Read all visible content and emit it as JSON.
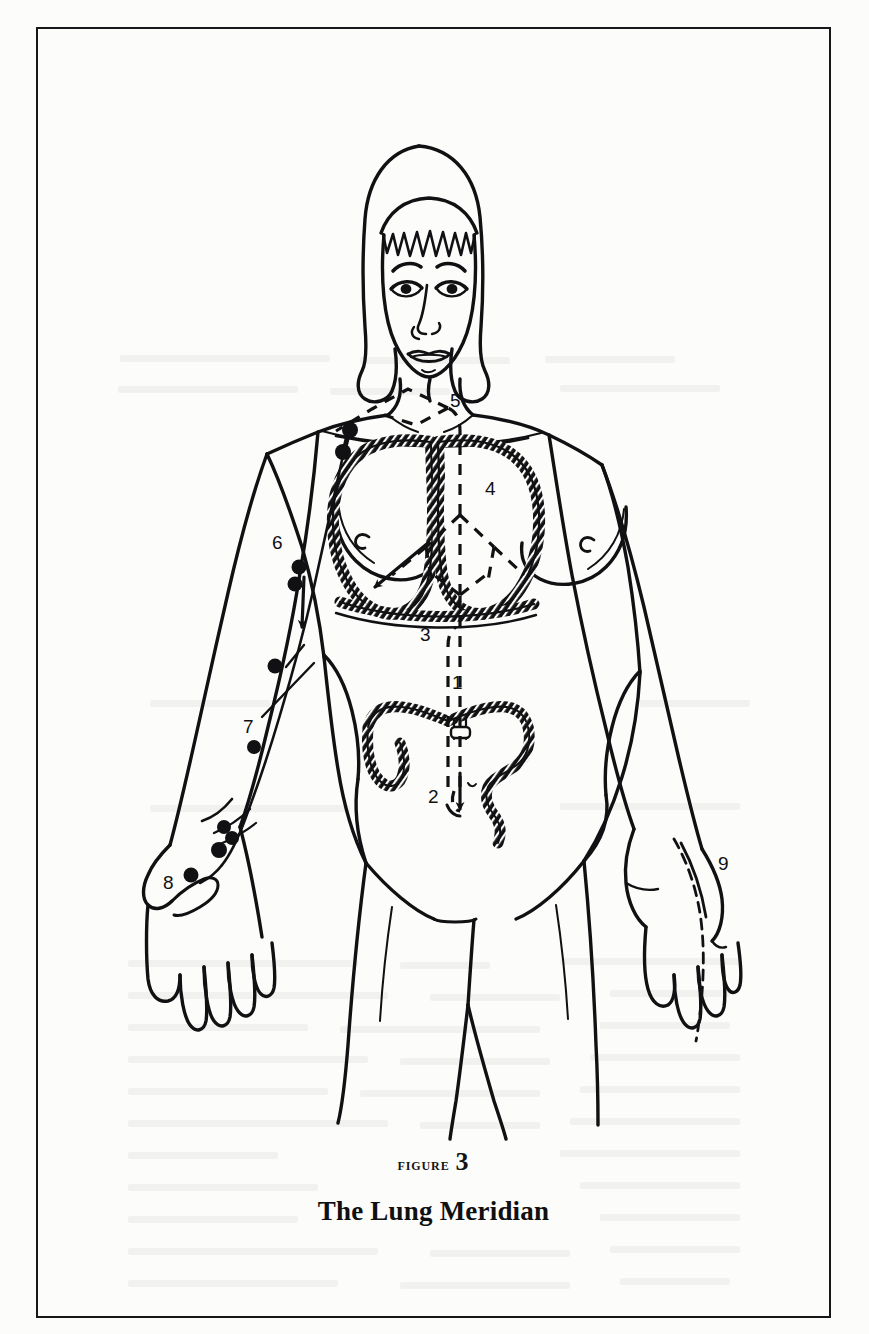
{
  "page": {
    "background_color": "#fcfcfa",
    "ink_color": "#141416",
    "width": 869,
    "height": 1334
  },
  "figure": {
    "frame": {
      "border_color": "#17171a",
      "border_width": 2
    },
    "caption": {
      "figure_word": "Figure",
      "figure_number": "3",
      "title": "The Lung Meridian"
    },
    "illustration": {
      "subject": "female-anatomical-figure-front-view",
      "description": "Line drawing of a standing woman, front view, showing the Lung meridian pathway with numbered reference points.",
      "organs_depicted": [
        "lungs",
        "diaphragm",
        "large-intestine",
        "stomach"
      ],
      "meridian_style": {
        "solid_line_meaning": "surface pathway",
        "dashed_line_meaning": "internal pathway",
        "point_marker": "filled-circle"
      }
    },
    "point_labels": [
      {
        "id": "1",
        "x": 452,
        "y": 655,
        "name": "point-label-1"
      },
      {
        "id": "2",
        "x": 428,
        "y": 768,
        "name": "point-label-2"
      },
      {
        "id": "3",
        "x": 420,
        "y": 608,
        "name": "point-label-3"
      },
      {
        "id": "4",
        "x": 485,
        "y": 461,
        "name": "point-label-4"
      },
      {
        "id": "5",
        "x": 450,
        "y": 373,
        "name": "point-label-5"
      },
      {
        "id": "6",
        "x": 272,
        "y": 516,
        "name": "point-label-6"
      },
      {
        "id": "7",
        "x": 243,
        "y": 699,
        "name": "point-label-7"
      },
      {
        "id": "8",
        "x": 163,
        "y": 855,
        "name": "point-label-8"
      },
      {
        "id": "9",
        "x": 718,
        "y": 836,
        "name": "point-label-9"
      }
    ]
  },
  "texture_lines": [
    {
      "x": 120,
      "y": 355,
      "w": 210
    },
    {
      "x": 360,
      "y": 357,
      "w": 150
    },
    {
      "x": 545,
      "y": 356,
      "w": 130
    },
    {
      "x": 118,
      "y": 386,
      "w": 180
    },
    {
      "x": 330,
      "y": 388,
      "w": 120
    },
    {
      "x": 560,
      "y": 385,
      "w": 160
    },
    {
      "x": 150,
      "y": 700,
      "w": 120
    },
    {
      "x": 640,
      "y": 700,
      "w": 110
    },
    {
      "x": 150,
      "y": 805,
      "w": 200
    },
    {
      "x": 560,
      "y": 803,
      "w": 180
    },
    {
      "x": 128,
      "y": 960,
      "w": 230
    },
    {
      "x": 400,
      "y": 962,
      "w": 90
    },
    {
      "x": 560,
      "y": 958,
      "w": 180
    },
    {
      "x": 128,
      "y": 992,
      "w": 260
    },
    {
      "x": 430,
      "y": 994,
      "w": 130
    },
    {
      "x": 610,
      "y": 990,
      "w": 120
    },
    {
      "x": 128,
      "y": 1024,
      "w": 180
    },
    {
      "x": 340,
      "y": 1026,
      "w": 200
    },
    {
      "x": 600,
      "y": 1022,
      "w": 130
    },
    {
      "x": 128,
      "y": 1056,
      "w": 240
    },
    {
      "x": 400,
      "y": 1058,
      "w": 150
    },
    {
      "x": 590,
      "y": 1054,
      "w": 150
    },
    {
      "x": 128,
      "y": 1088,
      "w": 200
    },
    {
      "x": 360,
      "y": 1090,
      "w": 180
    },
    {
      "x": 580,
      "y": 1086,
      "w": 160
    },
    {
      "x": 128,
      "y": 1120,
      "w": 260
    },
    {
      "x": 420,
      "y": 1122,
      "w": 120
    },
    {
      "x": 570,
      "y": 1118,
      "w": 170
    },
    {
      "x": 128,
      "y": 1152,
      "w": 150
    },
    {
      "x": 560,
      "y": 1150,
      "w": 180
    },
    {
      "x": 128,
      "y": 1184,
      "w": 190
    },
    {
      "x": 580,
      "y": 1182,
      "w": 160
    },
    {
      "x": 128,
      "y": 1216,
      "w": 170
    },
    {
      "x": 600,
      "y": 1214,
      "w": 140
    },
    {
      "x": 128,
      "y": 1248,
      "w": 250
    },
    {
      "x": 430,
      "y": 1250,
      "w": 140
    },
    {
      "x": 610,
      "y": 1246,
      "w": 130
    },
    {
      "x": 128,
      "y": 1280,
      "w": 210
    },
    {
      "x": 400,
      "y": 1282,
      "w": 170
    },
    {
      "x": 620,
      "y": 1278,
      "w": 110
    }
  ]
}
